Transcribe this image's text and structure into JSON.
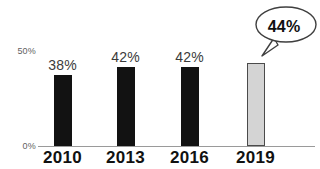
{
  "chart_data": {
    "type": "bar",
    "title": "",
    "title_note": "cropped off top edge, illegible",
    "xlabel": "",
    "ylabel": "",
    "categories": [
      "2010",
      "2013",
      "2016",
      "2019"
    ],
    "values": [
      38,
      42,
      42,
      44
    ],
    "value_labels": [
      "38%",
      "42%",
      "42%",
      "44%"
    ],
    "ylim": [
      0,
      50
    ],
    "ytick_values": [
      0,
      50
    ],
    "ytick_labels": [
      "0%",
      "50%"
    ],
    "grid": false,
    "legend": null,
    "series": [
      {
        "name": "share",
        "values": [
          38,
          42,
          42,
          44
        ]
      }
    ],
    "bar_colors": [
      "#121212",
      "#121212",
      "#121212",
      "#d4d4d4"
    ],
    "highlight_index": 3,
    "annotations": [
      {
        "type": "callout-bubble",
        "text": "44%",
        "target_category": "2019"
      }
    ]
  },
  "axis": {
    "y_top_label": "50%",
    "y_zero_label": "0%"
  },
  "callout": {
    "value": "44%"
  },
  "title": {
    "sliver": "——————————"
  }
}
